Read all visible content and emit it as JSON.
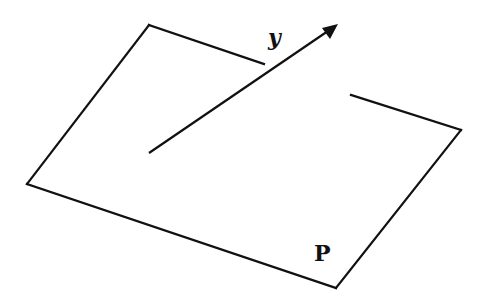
{
  "diagram": {
    "labels": {
      "vector": "y",
      "plane": "P"
    },
    "plane": {
      "segments": [
        {
          "name": "top-edge",
          "points": [
            [
              149,
              25
            ],
            [
              264,
              64
            ]
          ]
        },
        {
          "name": "left-edge",
          "points": [
            [
              149,
              25
            ],
            [
              27,
              184
            ]
          ]
        },
        {
          "name": "bottom-edge",
          "points": [
            [
              27,
              184
            ],
            [
              336,
              288
            ]
          ]
        },
        {
          "name": "right-edge",
          "points": [
            [
              336,
              288
            ],
            [
              461,
              130
            ]
          ]
        },
        {
          "name": "right-top-edge",
          "points": [
            [
              461,
              130
            ],
            [
              351,
              95
            ]
          ]
        }
      ]
    },
    "vector": {
      "start": [
        149,
        153
      ],
      "end": [
        338,
        24
      ]
    },
    "colors": {
      "stroke": "#111111",
      "background": "#ffffff"
    }
  }
}
